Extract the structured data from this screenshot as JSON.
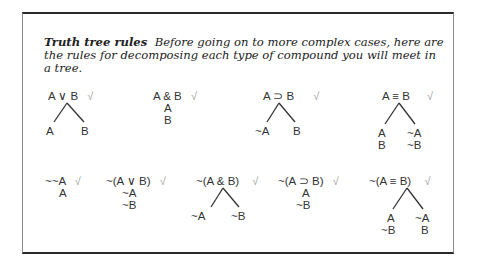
{
  "intro": {
    "heading": "Truth tree rules",
    "text": "Before going on to more complex cases, here are the rules for decomposing each type of compound you will meet in a tree."
  },
  "check_mark": "√",
  "rules": [
    {
      "name": "disjunction",
      "premise": "A ∨ B",
      "branching": true,
      "left": [
        "A"
      ],
      "right": [
        "B"
      ]
    },
    {
      "name": "conjunction",
      "premise": "A & B",
      "branching": false,
      "stack": [
        "A",
        "B"
      ]
    },
    {
      "name": "conditional",
      "premise": "A ⊃ B",
      "branching": true,
      "left": [
        "~A"
      ],
      "right": [
        "B"
      ]
    },
    {
      "name": "biconditional",
      "premise": "A ≡ B",
      "branching": true,
      "left": [
        "A",
        "B"
      ],
      "right": [
        "~A",
        "~B"
      ]
    },
    {
      "name": "double-negation",
      "premise": "~~A",
      "branching": false,
      "stack": [
        "A"
      ]
    },
    {
      "name": "negated-disjunction",
      "premise": "~(A ∨ B)",
      "branching": false,
      "stack": [
        "~A",
        "~B"
      ]
    },
    {
      "name": "negated-conjunction",
      "premise": "~(A & B)",
      "branching": true,
      "left": [
        "~A"
      ],
      "right": [
        "~B"
      ]
    },
    {
      "name": "negated-conditional",
      "premise": "~(A ⊃ B)",
      "branching": false,
      "stack": [
        "A",
        "~B"
      ]
    },
    {
      "name": "negated-biconditional",
      "premise": "~(A ≡ B)",
      "branching": true,
      "left": [
        "A",
        "~B"
      ],
      "right": [
        "~A",
        "B"
      ]
    }
  ]
}
